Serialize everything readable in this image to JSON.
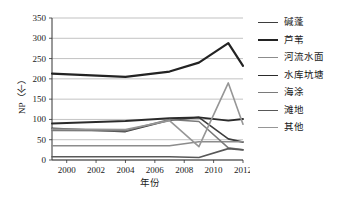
{
  "chart_data": {
    "type": "line",
    "title": "",
    "xlabel": "年份",
    "ylabel": "NP（个）",
    "grid": "horizontal",
    "legend_position": "right",
    "xlim": [
      1999,
      2012
    ],
    "ylim": [
      0,
      350
    ],
    "ytick_labels": [
      "0",
      "50",
      "100",
      "150",
      "200",
      "250",
      "300",
      "350"
    ],
    "ytick_values": [
      0,
      50,
      100,
      150,
      200,
      250,
      300,
      350
    ],
    "xtick_labels": [
      "2000",
      "2002",
      "2004",
      "2006",
      "2008",
      "2010",
      "2012"
    ],
    "xtick_values": [
      2000,
      2002,
      2004,
      2006,
      2008,
      2010,
      2012
    ],
    "x": [
      1999,
      2004,
      2007,
      2009,
      2011,
      2012
    ],
    "series": [
      {
        "name": "碱蓬",
        "color": "#3d3d3d",
        "width": 1.6,
        "values": [
          78,
          70,
          98,
          105,
          52,
          44
        ]
      },
      {
        "name": "芦苇",
        "color": "#232323",
        "width": 2.2,
        "values": [
          213,
          205,
          218,
          240,
          288,
          232
        ]
      },
      {
        "name": "河流水面",
        "color": "#8c8c8c",
        "width": 1.5,
        "values": [
          35,
          35,
          35,
          45,
          45,
          45
        ]
      },
      {
        "name": "水库坑塘",
        "color": "#2b2b2b",
        "width": 1.9,
        "values": [
          90,
          96,
          103,
          105,
          97,
          101
        ]
      },
      {
        "name": "海涂",
        "color": "#7a7a7a",
        "width": 1.5,
        "values": [
          73,
          72,
          100,
          95,
          30,
          25
        ]
      },
      {
        "name": "滩地",
        "color": "#585858",
        "width": 1.6,
        "values": [
          8,
          8,
          8,
          6,
          28,
          25
        ]
      },
      {
        "name": "其他",
        "color": "#969696",
        "width": 1.6,
        "values": [
          76,
          75,
          97,
          33,
          190,
          88
        ]
      }
    ]
  }
}
